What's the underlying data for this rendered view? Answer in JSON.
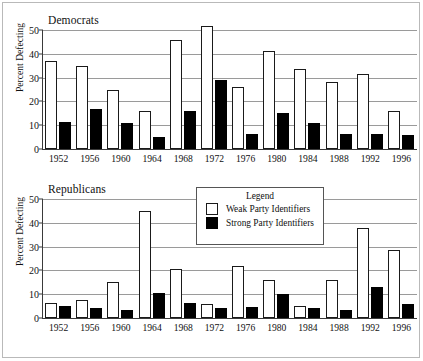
{
  "figure": {
    "ylabel": "Percent Defecting",
    "legend_title": "Legend",
    "legend_weak": "Weak Party Identifiers",
    "legend_strong": "Strong Party Identifiers",
    "panel_dem_title": "Democrats",
    "panel_rep_title": "Republicans",
    "yticks": [
      "0",
      "10",
      "20",
      "30",
      "40",
      "50"
    ],
    "years": [
      "1952",
      "1956",
      "1960",
      "1964",
      "1968",
      "1972",
      "1976",
      "1980",
      "1984",
      "1988",
      "1992",
      "1996"
    ],
    "colors": {
      "weak": "#ffffff",
      "strong": "#000000",
      "axis": "#3a3a3a",
      "grid": "#9a9a9a",
      "frame": "#b9b9b9"
    }
  },
  "chart_data": [
    {
      "type": "bar",
      "title": "Democrats",
      "xlabel": "",
      "ylabel": "Percent Defecting",
      "ylim": [
        0,
        50
      ],
      "yticks": [
        0,
        10,
        20,
        30,
        40,
        50
      ],
      "grid": true,
      "legend_position": "shared-lower-panel",
      "categories": [
        "1952",
        "1956",
        "1960",
        "1964",
        "1968",
        "1972",
        "1976",
        "1980",
        "1984",
        "1988",
        "1992",
        "1996"
      ],
      "series": [
        {
          "name": "Weak Party Identifiers",
          "color": "#ffffff",
          "values": [
            37,
            35,
            25,
            16,
            46,
            51.5,
            26,
            41,
            33.5,
            28,
            31.5,
            16
          ]
        },
        {
          "name": "Strong Party Identifiers",
          "color": "#000000",
          "values": [
            11.5,
            17,
            11,
            5,
            16,
            29,
            6.5,
            15,
            11,
            6.5,
            6.5,
            6
          ]
        }
      ]
    },
    {
      "type": "bar",
      "title": "Republicans",
      "xlabel": "",
      "ylabel": "Percent Defecting",
      "ylim": [
        0,
        50
      ],
      "yticks": [
        0,
        10,
        20,
        30,
        40,
        50
      ],
      "grid": true,
      "legend_position": "inside-upper-right",
      "categories": [
        "1952",
        "1956",
        "1960",
        "1964",
        "1968",
        "1972",
        "1976",
        "1980",
        "1984",
        "1988",
        "1992",
        "1996"
      ],
      "series": [
        {
          "name": "Weak Party Identifiers",
          "color": "#ffffff",
          "values": [
            6.5,
            7.5,
            15,
            45,
            20.5,
            6,
            22,
            16,
            5,
            16,
            38,
            28.5
          ]
        },
        {
          "name": "Strong Party Identifiers",
          "color": "#000000",
          "values": [
            5,
            4,
            3.5,
            10.5,
            6.5,
            4,
            4.5,
            10,
            4,
            3.5,
            13,
            6
          ]
        }
      ]
    }
  ]
}
